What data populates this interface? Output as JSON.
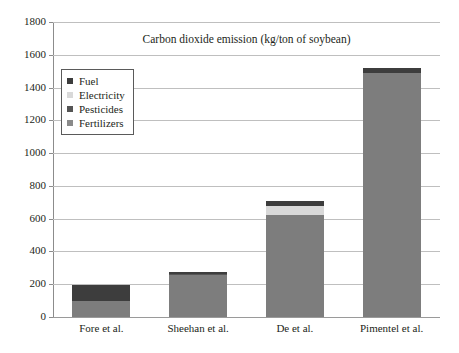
{
  "chart_data": {
    "type": "bar",
    "subtype": "stacked-bar",
    "title": "Carbon dioxide emission (kg/ton of soybean)",
    "xlabel": "",
    "ylabel": "",
    "ylim": [
      0,
      1800
    ],
    "ytick_step": 200,
    "ytick_labels": [
      "1800",
      "1600",
      "1400",
      "1200",
      "1000",
      "800",
      "600",
      "400",
      "200",
      "0"
    ],
    "ytick_values": [
      1800,
      1600,
      1400,
      1200,
      1000,
      800,
      600,
      400,
      200,
      0
    ],
    "grid": true,
    "grid_axis": "y",
    "legend_position": "upper-left-inside",
    "categories": [
      "Fore et al.",
      "Sheehan et al.",
      "De et al.",
      "Pimentel et al."
    ],
    "series": [
      {
        "name": "Fertilizers",
        "color": "#7d7d7d",
        "values": [
          95,
          255,
          625,
          1490
        ]
      },
      {
        "name": "Pesticides",
        "color": "#555555",
        "values": [
          0,
          5,
          0,
          0
        ]
      },
      {
        "name": "Electricity",
        "color": "#d9d9d9",
        "values": [
          0,
          0,
          55,
          0
        ]
      },
      {
        "name": "Fuel",
        "color": "#3d3d3d",
        "values": [
          102,
          13,
          30,
          30
        ]
      }
    ],
    "totals": [
      197,
      273,
      710,
      1520
    ]
  },
  "legend": {
    "items": [
      {
        "label": "Fuel",
        "color": "#3d3d3d"
      },
      {
        "label": "Electricity",
        "color": "#d9d9d9"
      },
      {
        "label": "Pesticides",
        "color": "#555555"
      },
      {
        "label": "Fertilizers",
        "color": "#8a8a8a"
      }
    ]
  },
  "colors": {
    "background": "#ffffff",
    "grid": "#bfbfbf",
    "axis": "#8c8c8c",
    "text": "#231f20"
  }
}
